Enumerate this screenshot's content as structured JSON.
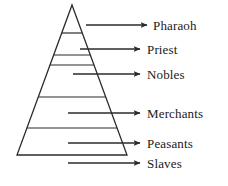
{
  "diagram": {
    "type": "pyramid-hierarchy",
    "stroke_color": "#2b2b2b",
    "fill_color": "#ffffff",
    "text_color": "#1a1a1a",
    "background_color": "#ffffff",
    "pyramid": {
      "apex": {
        "x": 72,
        "y": 5
      },
      "base_left": {
        "x": 17,
        "y": 155
      },
      "base_right": {
        "x": 127,
        "y": 155
      },
      "divider_y": [
        33,
        55,
        65,
        97,
        128
      ]
    },
    "tiers": [
      {
        "rank": 1,
        "label": "Pharaoh",
        "arrow": {
          "x1": 86,
          "x2": 147,
          "y": 25
        },
        "label_x": 153,
        "label_y": 19
      },
      {
        "rank": 2,
        "label": "Priest",
        "arrow": {
          "x1": 80,
          "x2": 140,
          "y": 49
        },
        "label_x": 147,
        "label_y": 43
      },
      {
        "rank": 3,
        "label": "Nobles",
        "arrow": {
          "x1": 73,
          "x2": 140,
          "y": 74
        },
        "label_x": 147,
        "label_y": 68
      },
      {
        "rank": 4,
        "label": "Merchants",
        "arrow": {
          "x1": 68,
          "x2": 140,
          "y": 113
        },
        "label_x": 147,
        "label_y": 107
      },
      {
        "rank": 5,
        "label": "Peasants",
        "arrow": {
          "x1": 68,
          "x2": 140,
          "y": 143
        },
        "label_x": 147,
        "label_y": 137
      },
      {
        "rank": 6,
        "label": "Slaves",
        "arrow": {
          "x1": 68,
          "x2": 140,
          "y": 163
        },
        "label_x": 147,
        "label_y": 157
      }
    ]
  }
}
